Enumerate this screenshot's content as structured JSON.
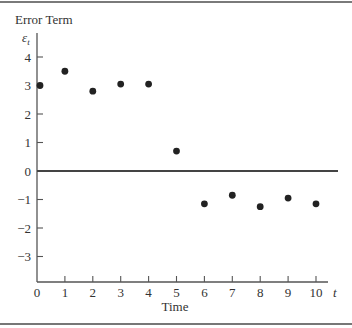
{
  "chart_data": {
    "type": "scatter",
    "title": "Error Term",
    "ylabel_symbol": "ε_t",
    "xlabel": "Time",
    "x_axis_symbol": "t",
    "x": [
      0,
      1,
      2,
      3,
      4,
      5,
      6,
      7,
      8,
      9,
      10
    ],
    "values": [
      3.0,
      3.5,
      2.8,
      3.05,
      3.05,
      0.7,
      -1.15,
      -0.85,
      -1.25,
      -0.95,
      -1.15
    ],
    "x_ticks": [
      "0",
      "1",
      "2",
      "3",
      "4",
      "5",
      "6",
      "7",
      "8",
      "9",
      "10"
    ],
    "y_ticks": [
      "4",
      "3",
      "2",
      "1",
      "0",
      "−1",
      "−2",
      "−3"
    ],
    "xlim": [
      0,
      10.7
    ],
    "ylim": [
      -4,
      4.6
    ],
    "zero_line": true,
    "grid": false,
    "legend": null
  },
  "labels": {
    "title": "Error Term",
    "y_symbol": "ε",
    "y_subscript": "t",
    "x_symbol": "t",
    "x_label": "Time"
  }
}
